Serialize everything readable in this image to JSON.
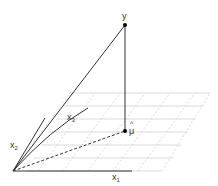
{
  "diagram": {
    "type": "least-squares-geometry",
    "labels": {
      "y": "y",
      "mu_hat": "μ",
      "mu_hat_accent": "^",
      "x1": "x",
      "x1_sub": "1",
      "x2": "x",
      "x2_sub": "2",
      "x3": "x",
      "x3_sub": "3"
    },
    "colors": {
      "line": "#333333",
      "grid": "#cccccc",
      "point": "#000000"
    }
  }
}
